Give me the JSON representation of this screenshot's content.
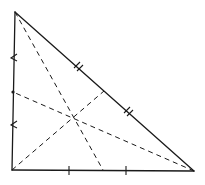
{
  "diagram": {
    "title": "",
    "colors": {
      "background": "#ffffff",
      "stroke": "#1a1a1a"
    },
    "vertices": {
      "A": {
        "x": 15,
        "y": 12
      },
      "B": {
        "x": 12,
        "y": 170
      },
      "C": {
        "x": 194,
        "y": 171
      }
    },
    "midpoints": {
      "AB": {
        "x": 13,
        "y": 92
      },
      "AC": {
        "x": 104,
        "y": 91
      },
      "BC": {
        "x": 103,
        "y": 170
      }
    },
    "centroid": {
      "x": 73,
      "y": 117
    },
    "medians": [
      {
        "from": "A",
        "to": "BC"
      },
      {
        "from": "B",
        "to": "AC"
      },
      {
        "from": "C",
        "to": "AB"
      }
    ],
    "tick_marks": {
      "AB": {
        "style": "single-arrow",
        "count": 2
      },
      "AC": {
        "style": "double",
        "count": 2
      },
      "BC": {
        "style": "single",
        "count": 2
      }
    }
  }
}
